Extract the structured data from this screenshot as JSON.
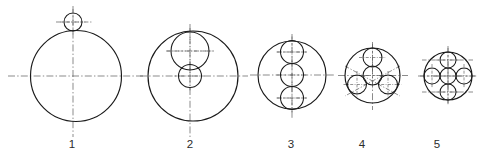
{
  "sheet": {
    "title": "Circle packing construction figures",
    "background_color": "#ffffff",
    "line_color": "#1a1a1a",
    "centerline_color": "#5a5a5a",
    "width": 480,
    "height": 159
  },
  "figures": [
    {
      "label": "1",
      "label_x": 72,
      "label_y": 148,
      "outer": {
        "cx": 76,
        "cy": 76,
        "r": 45.5
      },
      "inner_count": 1,
      "inner": [
        {
          "cx": 73,
          "cy": 22,
          "r": 9,
          "name": "top-small-circle"
        }
      ],
      "hcenterline": {
        "x1": 8,
        "x2": 144,
        "y": 76
      },
      "vcenterline": {
        "y1": 6,
        "y2": 137,
        "x": 73
      },
      "extra_centerlines": [
        {
          "type": "horizontal",
          "x1": 56,
          "x2": 92,
          "y": 22
        }
      ]
    },
    {
      "label": "2",
      "label_x": 190,
      "label_y": 148,
      "outer": {
        "cx": 193,
        "cy": 76,
        "r": 45
      },
      "inner_count": 2,
      "inner": [
        {
          "cx": 190,
          "cy": 51,
          "r": 19,
          "name": "upper-medium-circle"
        },
        {
          "cx": 190,
          "cy": 76,
          "r": 11.5,
          "name": "center-small-circle"
        }
      ],
      "hcenterline": {
        "x1": 140,
        "x2": 248,
        "y": 76
      },
      "vcenterline": {
        "y1": 24,
        "y2": 137,
        "x": 190
      },
      "extra_centerlines": [
        {
          "type": "horizontal",
          "x1": 166,
          "x2": 214,
          "y": 51
        }
      ]
    },
    {
      "label": "3",
      "label_x": 291,
      "label_y": 148,
      "outer": {
        "cx": 292,
        "cy": 75,
        "r": 34
      },
      "inner_count": 3,
      "inner": [
        {
          "cx": 292,
          "cy": 52,
          "r": 11.5,
          "name": "top-circle"
        },
        {
          "cx": 292,
          "cy": 75,
          "r": 11.5,
          "name": "middle-circle"
        },
        {
          "cx": 292,
          "cy": 98,
          "r": 11.5,
          "name": "bottom-circle"
        }
      ],
      "hcenterline": {
        "x1": 250,
        "x2": 336,
        "y": 75
      },
      "vcenterline": {
        "y1": 34,
        "y2": 118,
        "x": 292
      },
      "extra_centerlines": [
        {
          "type": "horizontal",
          "x1": 277,
          "x2": 307,
          "y": 52
        },
        {
          "type": "horizontal",
          "x1": 277,
          "x2": 307,
          "y": 98
        }
      ]
    },
    {
      "label": "4",
      "label_x": 362,
      "label_y": 148,
      "outer": {
        "cx": 372.5,
        "cy": 75.5,
        "r": 27.5
      },
      "inner_count": 4,
      "inner": [
        {
          "cx": 372.5,
          "cy": 75.5,
          "r": 9.5,
          "name": "center-circle"
        },
        {
          "cx": 372.5,
          "cy": 57.5,
          "r": 9.5,
          "name": "top-satellite"
        },
        {
          "cx": 357,
          "cy": 84.5,
          "r": 9.5,
          "name": "lower-left-satellite"
        },
        {
          "cx": 388,
          "cy": 84.5,
          "r": 9.5,
          "name": "lower-right-satellite"
        }
      ],
      "hcenterline": {
        "x1": 338,
        "x2": 408,
        "y": 75.5
      },
      "vcenterline": {
        "y1": 42,
        "y2": 110,
        "x": 372.5
      },
      "extra_centerlines": [
        {
          "type": "oblique",
          "x1": 345,
          "y1": 66,
          "x2": 400,
          "y2": 96
        },
        {
          "type": "oblique",
          "x1": 400,
          "y1": 66,
          "x2": 345,
          "y2": 96
        }
      ]
    },
    {
      "label": "5",
      "label_x": 437,
      "label_y": 148,
      "outer": {
        "cx": 448,
        "cy": 76,
        "r": 24
      },
      "inner_count": 5,
      "inner": [
        {
          "cx": 448,
          "cy": 76,
          "r": 8,
          "name": "center-circle"
        },
        {
          "cx": 448,
          "cy": 60,
          "r": 8,
          "name": "top-satellite"
        },
        {
          "cx": 448,
          "cy": 92,
          "r": 8,
          "name": "bottom-satellite"
        },
        {
          "cx": 432,
          "cy": 76,
          "r": 8,
          "name": "left-satellite"
        },
        {
          "cx": 464,
          "cy": 76,
          "r": 8,
          "name": "right-satellite"
        }
      ],
      "hcenterline": {
        "x1": 418,
        "x2": 478,
        "y": 76
      },
      "vcenterline": {
        "y1": 46,
        "y2": 106,
        "x": 448
      },
      "extra_centerlines": [
        {
          "type": "horizontal",
          "x1": 422,
          "x2": 474,
          "y": 60
        },
        {
          "type": "horizontal",
          "x1": 422,
          "x2": 474,
          "y": 92
        }
      ]
    }
  ]
}
